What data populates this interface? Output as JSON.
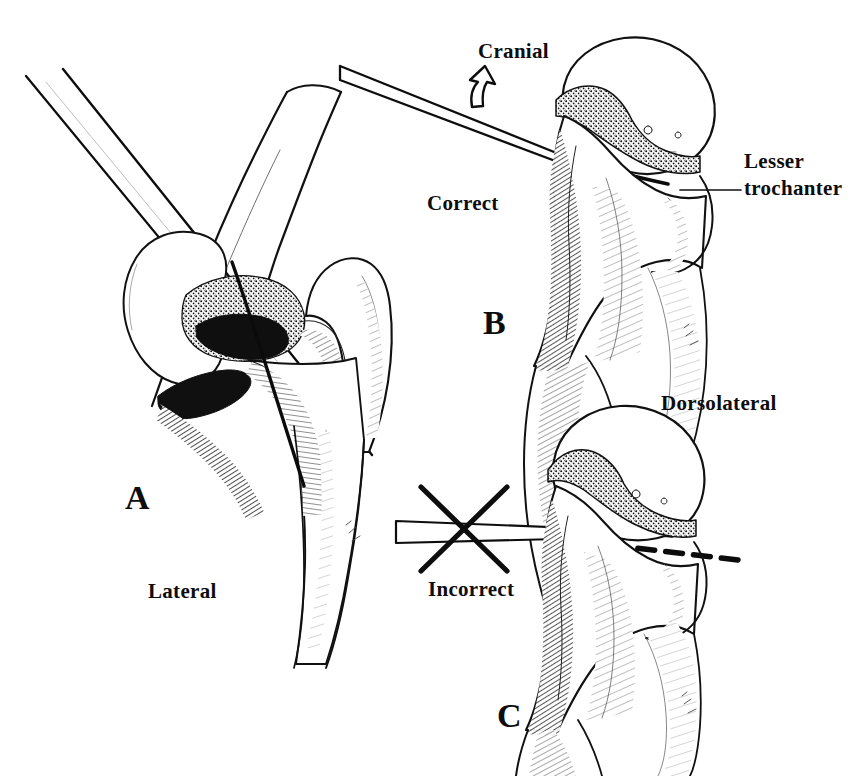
{
  "figure": {
    "kind": "anatomical-line-drawing",
    "background_color": "#ffffff",
    "ink_color": "#0d0d0d",
    "width": 862,
    "height": 776
  },
  "panels": [
    {
      "id": "A",
      "letter": "A",
      "view_label": "Lateral",
      "description": "Lateral view of proximal femur with two pins driven obliquely across the femoral neck fracture"
    },
    {
      "id": "B",
      "letter": "B",
      "status_label": "Correct",
      "orientation_label": "Cranial",
      "callout_label": "Lesser\ntrochanter",
      "callout_line1": "Lesser",
      "callout_line2": "trochanter",
      "description": "Dorsolateral view, pin angled cranially through the femoral neck into the head"
    },
    {
      "id": "C",
      "letter": "C",
      "status_label": "Incorrect",
      "description": "Dorsolateral view, pin driven horizontally; marked with a large X as incorrect"
    }
  ],
  "shared_labels": {
    "dorsolateral": "Dorsolateral"
  },
  "icons": {
    "cranial_arrow": "outlined-up-arrow",
    "incorrect_mark": "x-cross"
  }
}
